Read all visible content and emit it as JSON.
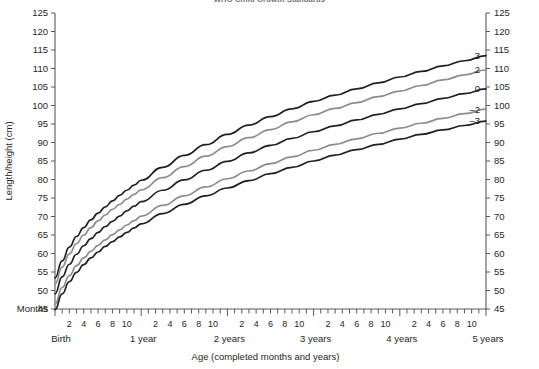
{
  "title": "WHO Child Growth Standards",
  "axes": {
    "y_label": "Length/height (cm)",
    "x_label": "Age (completed months and years)",
    "months_word": "Months",
    "y_ticks": [
      45,
      50,
      55,
      60,
      65,
      70,
      75,
      80,
      85,
      90,
      95,
      100,
      105,
      110,
      115,
      120,
      125
    ],
    "month_ticks": [
      2,
      4,
      6,
      8,
      10
    ],
    "year_labels": [
      "Birth",
      "1 year",
      "2 years",
      "3 years",
      "4 years",
      "5 years"
    ]
  },
  "colors": {
    "black": "#231f20",
    "gray": "#8c8c8c",
    "axis": "#58595b",
    "title": "#6f6f6f"
  },
  "chart_data": {
    "type": "line",
    "title": "WHO Child Growth Standards",
    "xlabel": "Age (completed months and years)",
    "ylabel": "Length/height (cm)",
    "xlim": [
      0,
      60
    ],
    "ylim": [
      45,
      125
    ],
    "grid": false,
    "legend_position": "right-inline",
    "x_unit": "months",
    "x": [
      0,
      1,
      2,
      3,
      4,
      5,
      6,
      7,
      8,
      9,
      10,
      11,
      12,
      15,
      18,
      21,
      24,
      27,
      30,
      33,
      36,
      39,
      42,
      45,
      48,
      51,
      54,
      57,
      60
    ],
    "series": [
      {
        "name": "3",
        "label": "3",
        "color": "#231f20",
        "values": [
          53.4,
          58.0,
          61.7,
          64.6,
          67.0,
          69.1,
          70.9,
          72.6,
          74.2,
          75.7,
          77.1,
          78.5,
          79.8,
          83.3,
          86.5,
          89.4,
          92.2,
          94.7,
          97.0,
          99.1,
          101.1,
          102.8,
          104.5,
          106.1,
          107.7,
          109.2,
          110.7,
          112.1,
          113.5
        ]
      },
      {
        "name": "2",
        "label": "2",
        "color": "#8c8c8c",
        "values": [
          51.8,
          56.3,
          59.9,
          62.7,
          65.0,
          67.0,
          68.8,
          70.4,
          71.9,
          73.3,
          74.7,
          76.0,
          77.2,
          80.5,
          83.5,
          86.3,
          88.9,
          91.3,
          93.5,
          95.6,
          97.5,
          99.2,
          100.8,
          102.4,
          103.9,
          105.4,
          106.9,
          108.3,
          109.6
        ]
      },
      {
        "name": "0",
        "label": "0",
        "color": "#231f20",
        "values": [
          49.1,
          53.7,
          57.1,
          59.8,
          62.1,
          64.0,
          65.7,
          67.3,
          68.7,
          70.1,
          71.5,
          72.8,
          74.0,
          77.1,
          79.9,
          82.5,
          84.9,
          87.2,
          89.2,
          91.1,
          92.9,
          94.5,
          96.1,
          97.6,
          99.1,
          100.5,
          101.9,
          103.2,
          104.5
        ]
      },
      {
        "name": "-2",
        "label": "–2",
        "color": "#8c8c8c",
        "values": [
          46.3,
          50.8,
          54.0,
          56.7,
          58.8,
          60.6,
          62.2,
          63.7,
          65.1,
          66.4,
          67.7,
          68.9,
          70.1,
          73.0,
          75.6,
          78.0,
          80.2,
          82.3,
          84.3,
          86.1,
          87.9,
          89.5,
          91.0,
          92.5,
          93.9,
          95.2,
          96.5,
          97.8,
          99.0
        ]
      },
      {
        "name": "-3",
        "label": "–3",
        "color": "#231f20",
        "values": [
          44.8,
          49.1,
          52.4,
          54.9,
          57.0,
          58.8,
          60.4,
          61.9,
          63.2,
          64.5,
          65.7,
          66.9,
          68.0,
          70.8,
          73.3,
          75.6,
          77.7,
          79.7,
          81.6,
          83.3,
          85.0,
          86.6,
          88.1,
          89.5,
          90.9,
          92.2,
          93.4,
          94.6,
          95.8
        ]
      }
    ]
  }
}
